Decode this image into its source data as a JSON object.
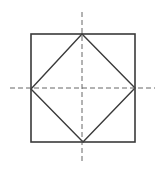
{
  "diagram": {
    "colors": {
      "background": "#ffffff",
      "stroke": "#3a3a3a",
      "axis": "#555555"
    },
    "outer_square": {
      "x": 31,
      "y": 34,
      "width": 104,
      "height": 108
    },
    "diamond": {
      "top": [
        82,
        34
      ],
      "right": [
        135,
        88
      ],
      "bottom": [
        83,
        142
      ],
      "left": [
        31,
        89
      ]
    },
    "axes": {
      "vertical": {
        "x": 82,
        "y1": 12,
        "y2": 163
      },
      "horizontal": {
        "y": 88,
        "x1": 10,
        "x2": 155
      }
    }
  }
}
